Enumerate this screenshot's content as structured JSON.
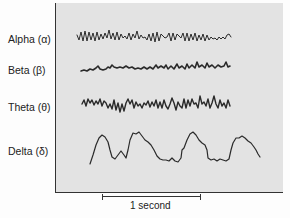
{
  "figure": {
    "type": "EEG brain wave patterns",
    "waves": [
      {
        "name": "Alpha",
        "label": "Alpha (α)"
      },
      {
        "name": "Beta",
        "label": "Beta (β)"
      },
      {
        "name": "Theta",
        "label": "Theta (θ)"
      },
      {
        "name": "Delta",
        "label": "Delta (δ)"
      }
    ],
    "scale_bar": {
      "label": "1 second"
    },
    "colors": {
      "panel": "#e3e3e3",
      "trace": "#222222"
    }
  }
}
